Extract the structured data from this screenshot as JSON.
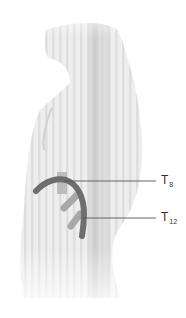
{
  "figure": {
    "colors": {
      "body_fill": "#ececec",
      "body_stripe": "#dcdcdc",
      "spine": "#cfcfcf",
      "band_dark": "#6e6e6e",
      "band_light": "#a8a8a8",
      "leader_line": "#555555",
      "label_text": "#333333"
    }
  },
  "labels": [
    {
      "id": "t8",
      "main": "T",
      "sub": "8"
    },
    {
      "id": "t12",
      "main": "T",
      "sub": "12"
    }
  ]
}
